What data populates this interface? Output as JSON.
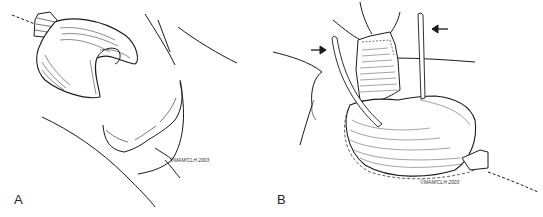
{
  "figure": {
    "type": "surgical line illustration",
    "panels": [
      {
        "label": "A",
        "signature": "©MAM/CLH 2003",
        "description": "Line drawing of a mobilized organ with a tied-off stump and an adjacent lobulated mass outlined by body contour lines"
      },
      {
        "label": "B",
        "signature": "©MAM/CLH 2003",
        "description": "Line drawing of a hatched organ with two tubes (indicated by arrows) inserted from above, a dashed incision line extending to the lower right",
        "arrows": [
          {
            "direction": "right",
            "points_to": "left tube"
          },
          {
            "direction": "left",
            "points_to": "right tube"
          }
        ]
      }
    ],
    "colors": {
      "background": "#ffffff",
      "ink": "#1a1a1a"
    }
  }
}
